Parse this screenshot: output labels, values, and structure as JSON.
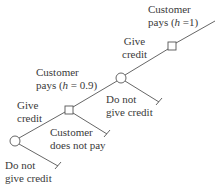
{
  "diagram": {
    "type": "decision-tree",
    "colors": {
      "line": "#555555",
      "text": "#3a3a3a",
      "background": "#ffffff"
    },
    "nodes": [
      {
        "id": "c1",
        "kind": "chance-circle",
        "x": 15,
        "y": 141
      },
      {
        "id": "s1",
        "kind": "decision-square",
        "x": 69,
        "y": 110
      },
      {
        "id": "c2",
        "kind": "chance-circle",
        "x": 121,
        "y": 78
      },
      {
        "id": "s2",
        "kind": "decision-square",
        "x": 172,
        "y": 46
      }
    ],
    "labels": {
      "top_customer_pays": {
        "line1": "Customer",
        "line2_prefix": "pays (",
        "var": "h",
        "line2_suffix": " =1)"
      },
      "upper_give_credit": {
        "line1": "Give",
        "line2": "credit"
      },
      "mid_customer_pays": {
        "line1": "Customer",
        "line2_prefix": "pays (",
        "var": "h",
        "line2_suffix": " = 0.9)"
      },
      "upper_do_not_give": {
        "line1": "Do not",
        "line2": "give credit"
      },
      "lower_give_credit": {
        "line1": "Give",
        "line2": "credit"
      },
      "customer_does_not_pay": {
        "line1": "Customer",
        "line2": "does not pay"
      },
      "lower_do_not_give": {
        "line1": "Do not",
        "line2": "give credit"
      }
    }
  }
}
